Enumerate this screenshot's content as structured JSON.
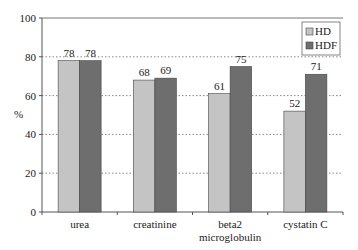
{
  "chart_data": {
    "type": "bar",
    "title": "",
    "xlabel": "",
    "ylabel": "%",
    "ylim": [
      0,
      100
    ],
    "yticks": [
      0,
      20,
      40,
      60,
      80,
      100
    ],
    "grid": "dotted horizontal",
    "legend_position": "top-right",
    "categories": [
      "urea",
      "creatinine",
      "beta2 microglobulin",
      "cystatin C"
    ],
    "category_lines": [
      [
        "urea"
      ],
      [
        "creatinine"
      ],
      [
        "beta2",
        "microglobulin"
      ],
      [
        "cystatin C"
      ]
    ],
    "series": [
      {
        "name": "HD",
        "color": "#c4c4c4",
        "values": [
          78,
          68,
          61,
          52
        ]
      },
      {
        "name": "HDF",
        "color": "#6e6e6e",
        "values": [
          78,
          69,
          75,
          71
        ]
      }
    ]
  }
}
